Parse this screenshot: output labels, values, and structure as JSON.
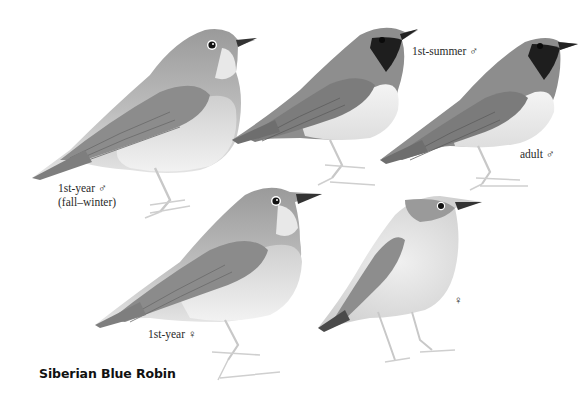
{
  "plate": {
    "title": "Siberian Blue Robin",
    "background": "#ffffff",
    "ink_color": "#2a2a2a"
  },
  "figures": [
    {
      "id": "1st-year-male",
      "label_line1": "1st-year ♂",
      "label_line2": "(fall–winter)",
      "position": "top-left"
    },
    {
      "id": "1st-summer-male",
      "label_line1": "1st-summer ♂",
      "position": "top-center"
    },
    {
      "id": "adult-male",
      "label_line1": "adult ♂",
      "position": "top-right"
    },
    {
      "id": "1st-year-female",
      "label_line1": "1st-year ♀",
      "position": "bottom-left"
    },
    {
      "id": "female",
      "label_line1": "♀",
      "position": "bottom-right"
    }
  ],
  "colors": {
    "upperparts": "#8a8a8a",
    "wing": "#7a7a7a",
    "underparts": "#e4e4e4",
    "throat_dark": "#1e1e1e",
    "legs": "#d8d8d8",
    "eye": "#111111"
  }
}
